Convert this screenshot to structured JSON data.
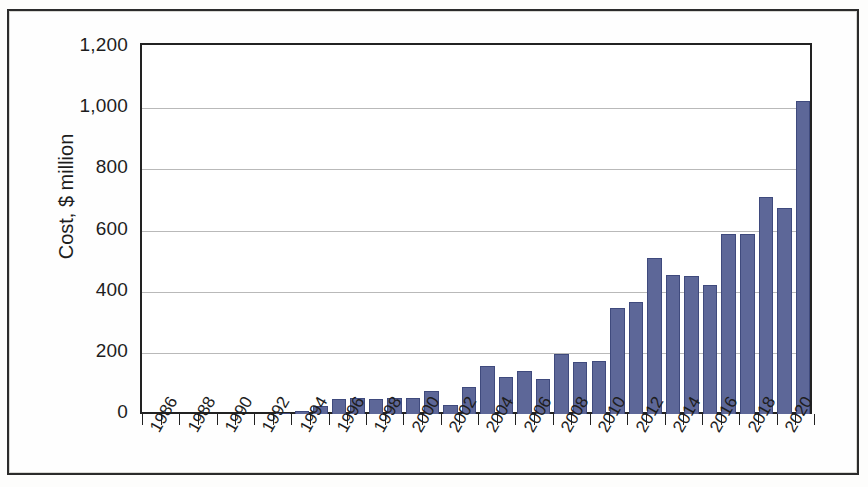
{
  "chart_data": {
    "type": "bar",
    "title": "",
    "subtitle": "",
    "xlabel": "",
    "ylabel": "Cost, $ million",
    "ylim": [
      0,
      1200
    ],
    "ytick_labels": [
      "0",
      "200",
      "400",
      "600",
      "800",
      "1,000",
      "1,200"
    ],
    "ytick_values": [
      0,
      200,
      400,
      600,
      800,
      1000,
      1200
    ],
    "grid": true,
    "legend": "none",
    "bar_color": "#5d6798",
    "bar_edge_color": "#3f4a7d",
    "categories": [
      "1986",
      "1987",
      "1988",
      "1989",
      "1990",
      "1991",
      "1992",
      "1993",
      "1994",
      "1995",
      "1996",
      "1997",
      "1998",
      "1999",
      "2000",
      "2001",
      "2002",
      "2003",
      "2004",
      "2005",
      "2006",
      "2007",
      "2008",
      "2009",
      "2010",
      "2011",
      "2012",
      "2013",
      "2014",
      "2015",
      "2016",
      "2017",
      "2018",
      "2019",
      "2020",
      "2021"
    ],
    "values": [
      0,
      0,
      0,
      0,
      0,
      0,
      0,
      3,
      10,
      25,
      50,
      52,
      50,
      52,
      52,
      75,
      30,
      88,
      158,
      122,
      140,
      115,
      196,
      170,
      172,
      347,
      365,
      510,
      455,
      452,
      422,
      590,
      588,
      710,
      672,
      1025
    ],
    "xtick_labels": [
      "1986",
      "1988",
      "1990",
      "1992",
      "1994",
      "1996",
      "1998",
      "2000",
      "2002",
      "2004",
      "2006",
      "2008",
      "2010",
      "2012",
      "2014",
      "2016",
      "2018",
      "2020"
    ],
    "xtick_label_rotation": -60,
    "x_range": [
      "1986",
      "2021"
    ]
  }
}
